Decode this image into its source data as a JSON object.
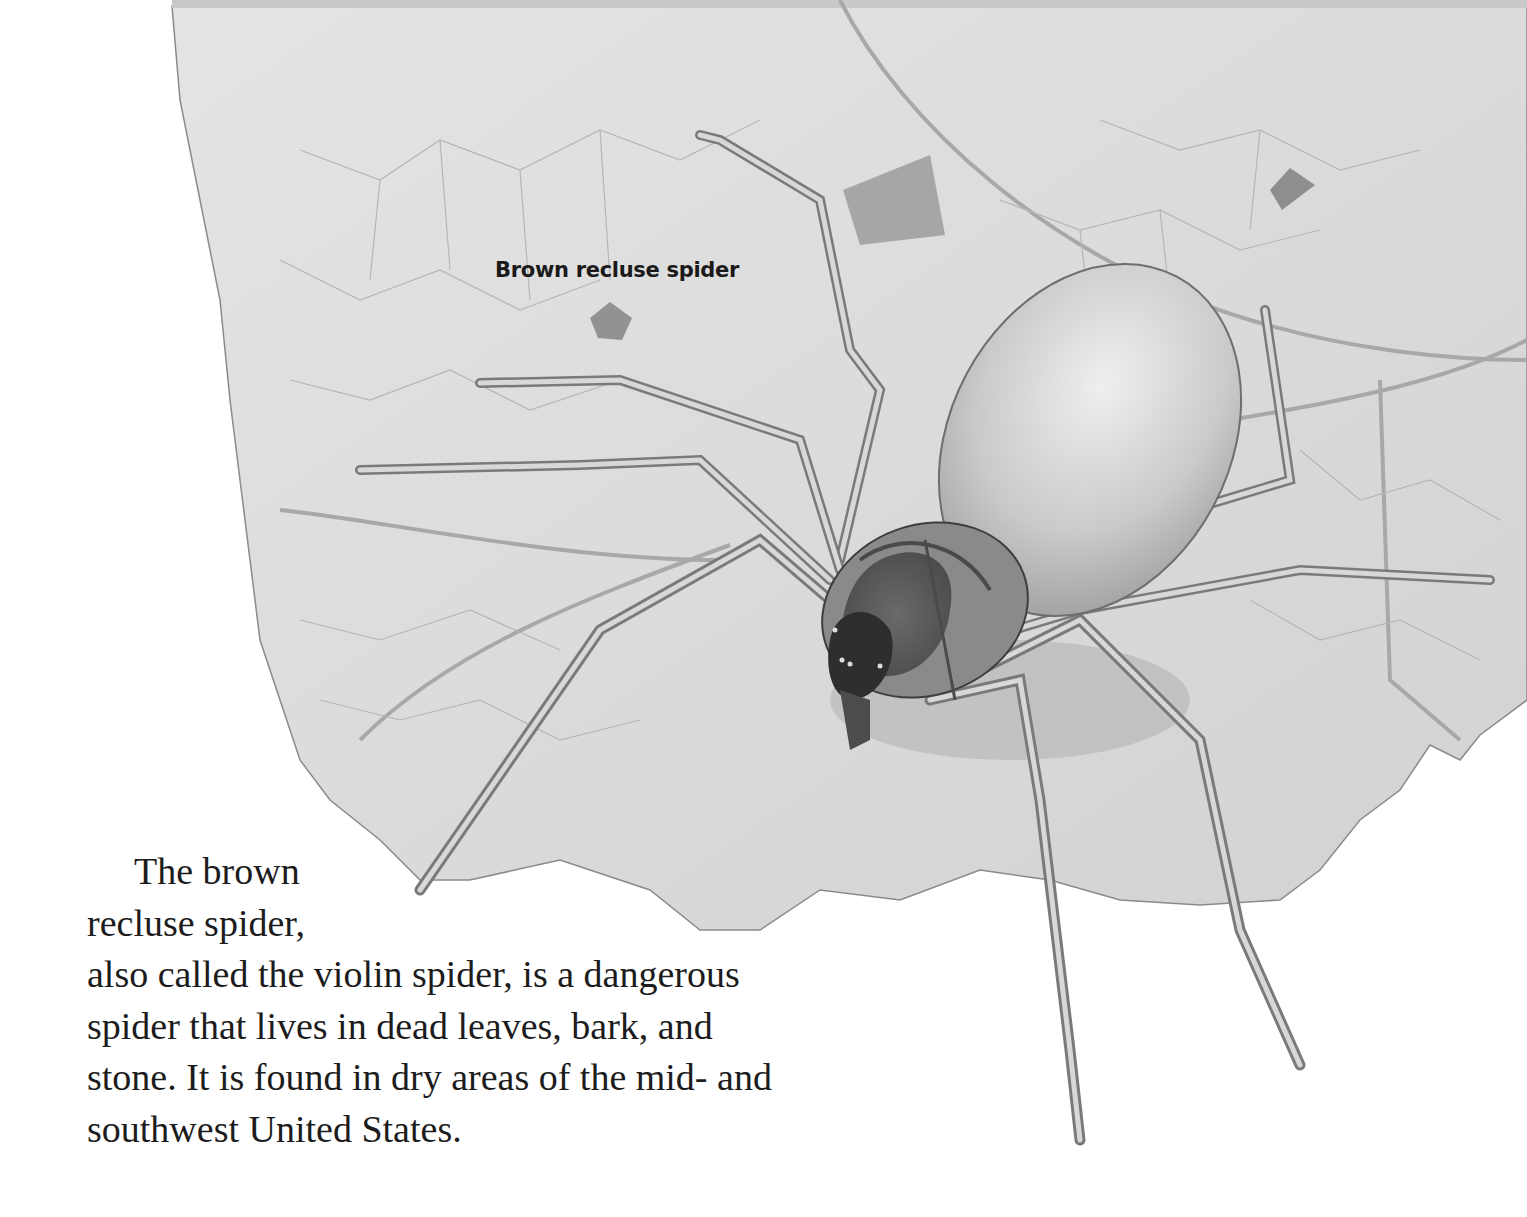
{
  "illustration": {
    "subject": "brown recluse spider on a dead leaf",
    "style": "grayscale pencil illustration",
    "colors": {
      "background": "#ffffff",
      "leaf": "#dcdcdc",
      "leaf_vein": "#9a9a9a",
      "spider_body": "#8c8c8c",
      "spider_abdomen": "#cfcfcf",
      "violin_mark": "#3a3a3a"
    }
  },
  "label": {
    "text": "Brown recluse spider"
  },
  "body": {
    "lines": [
      "The brown",
      "recluse spider,",
      "also called the violin spider, is a dangerous",
      "spider that lives in dead leaves, bark, and",
      "stone. It is found in dry areas of the mid- and",
      "southwest United States."
    ]
  }
}
